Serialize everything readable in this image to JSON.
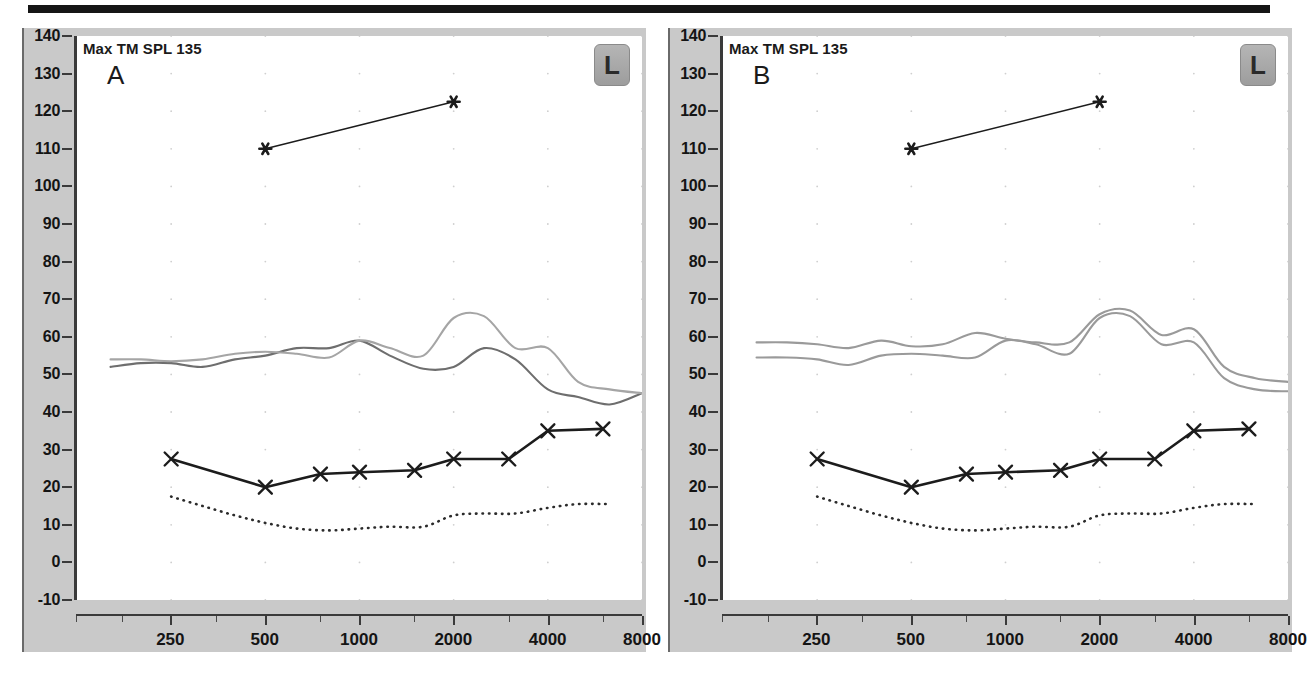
{
  "figure": {
    "top_rule": true,
    "panels": [
      {
        "id": "A",
        "letter": "A",
        "title": "Max TM SPL 135",
        "ear_badge": "L",
        "badge_meaning": "left-ear"
      },
      {
        "id": "B",
        "letter": "B",
        "title": "Max TM SPL 135",
        "ear_badge": "L",
        "badge_meaning": "left-ear"
      }
    ]
  },
  "axes": {
    "y_ticks": [
      140,
      130,
      120,
      110,
      100,
      90,
      80,
      70,
      60,
      50,
      40,
      30,
      20,
      10,
      0,
      -10
    ],
    "y_min": -10,
    "y_max": 140,
    "y_unit": "dB SPL",
    "x_labels": [
      "250",
      "500",
      "1000",
      "2000",
      "4000",
      "8000"
    ],
    "x_values": [
      250,
      500,
      1000,
      2000,
      4000,
      8000
    ],
    "x_minor_values": [
      125,
      175,
      350,
      750,
      1500,
      3000,
      6000
    ],
    "x_min": 125,
    "x_max": 8000,
    "x_unit": "Hz",
    "grid": "dots"
  },
  "colors": {
    "panel_gutter": "#c9c9c9",
    "plot_bg": "#ffffff",
    "axis": "#3a3a3a",
    "text": "#141414",
    "threshold_line": "#1c1c1c",
    "ucl_line": "#1c1c1c",
    "dotted_line": "#2b2b2b",
    "curve_dark_gray": "#6e6e6e",
    "curve_light_gray": "#a5a5a5",
    "top_rule": "#151515",
    "badge": "#a8a8a8"
  },
  "chart_data": [
    {
      "type": "line",
      "title": "Max TM SPL 135",
      "panel": "A",
      "xlabel": "Frequency (Hz)",
      "ylabel": "dB SPL",
      "xlim": [
        125,
        8000
      ],
      "ylim": [
        -10,
        140
      ],
      "xscale": "log",
      "grid": "dotted grid points at octave frequencies and 10 dB steps",
      "legend": "none",
      "annotations": [
        "Max TM SPL 135",
        "A",
        "L"
      ],
      "series": [
        {
          "name": "UCL (asterisk)",
          "marker": "asterisk",
          "style": "solid-thin",
          "color": "#1c1c1c",
          "x": [
            500,
            2000
          ],
          "values": [
            110,
            122.5
          ]
        },
        {
          "name": "Threshold (X marker)",
          "marker": "x",
          "style": "solid-thick",
          "color": "#1c1c1c",
          "x": [
            250,
            500,
            750,
            1000,
            1500,
            2000,
            3000,
            4000,
            6000
          ],
          "values": [
            27.5,
            20,
            23.5,
            24,
            24.5,
            27.5,
            27.5,
            35,
            35.5
          ]
        },
        {
          "name": "Aided response dark gray",
          "style": "solid",
          "color": "#6e6e6e",
          "x": [
            160,
            200,
            250,
            315,
            400,
            500,
            630,
            800,
            1000,
            1250,
            1600,
            2000,
            2500,
            3150,
            4000,
            5000,
            6300,
            8000
          ],
          "values": [
            52,
            53,
            53,
            52,
            54,
            55,
            57,
            57,
            59,
            55,
            51.5,
            52,
            57,
            54,
            46,
            44,
            42,
            45
          ]
        },
        {
          "name": "Aided response light gray",
          "style": "solid",
          "color": "#a5a5a5",
          "x": [
            160,
            200,
            250,
            315,
            400,
            500,
            630,
            800,
            1000,
            1250,
            1600,
            2000,
            2500,
            3150,
            4000,
            5000,
            6300,
            8000
          ],
          "values": [
            54,
            54,
            53.5,
            54,
            55.5,
            56,
            55.5,
            54.5,
            59,
            57,
            55,
            65,
            65.5,
            57,
            57,
            48,
            46,
            45
          ]
        },
        {
          "name": "Unaided / noise floor (dotted)",
          "style": "dotted",
          "color": "#2b2b2b",
          "x": [
            250,
            315,
            400,
            500,
            630,
            800,
            1000,
            1250,
            1600,
            2000,
            2500,
            3150,
            4000,
            5000,
            6300
          ],
          "values": [
            17.5,
            15,
            12.5,
            10.5,
            9,
            8.5,
            9,
            9.5,
            9.5,
            12.5,
            13,
            13,
            14.5,
            15.5,
            15.5
          ]
        }
      ]
    },
    {
      "type": "line",
      "title": "Max TM SPL 135",
      "panel": "B",
      "xlabel": "Frequency (Hz)",
      "ylabel": "dB SPL",
      "xlim": [
        125,
        8000
      ],
      "ylim": [
        -10,
        140
      ],
      "xscale": "log",
      "grid": "dotted grid points at octave frequencies and 10 dB steps",
      "legend": "none",
      "annotations": [
        "Max TM SPL 135",
        "B",
        "L"
      ],
      "series": [
        {
          "name": "UCL (asterisk)",
          "marker": "asterisk",
          "style": "solid-thin",
          "color": "#1c1c1c",
          "x": [
            500,
            2000
          ],
          "values": [
            110,
            122.5
          ]
        },
        {
          "name": "Threshold (X marker)",
          "marker": "x",
          "style": "solid-thick",
          "color": "#1c1c1c",
          "x": [
            250,
            500,
            750,
            1000,
            1500,
            2000,
            3000,
            4000,
            6000
          ],
          "values": [
            27.5,
            20,
            23.5,
            24,
            24.5,
            27.5,
            27.5,
            35,
            35.5
          ]
        },
        {
          "name": "Aided response upper gray",
          "style": "solid",
          "color": "#9a9a9a",
          "x": [
            160,
            200,
            250,
            315,
            400,
            500,
            630,
            800,
            1000,
            1250,
            1600,
            2000,
            2500,
            3150,
            4000,
            5000,
            6300,
            8000
          ],
          "values": [
            58.5,
            58.5,
            58,
            57,
            59,
            57.5,
            58,
            61,
            59.5,
            58.5,
            58.5,
            66,
            67,
            60.5,
            62,
            52,
            49,
            48
          ]
        },
        {
          "name": "Aided response lower gray",
          "style": "solid",
          "color": "#9a9a9a",
          "x": [
            160,
            200,
            250,
            315,
            400,
            500,
            630,
            800,
            1000,
            1250,
            1600,
            2000,
            2500,
            3150,
            4000,
            5000,
            6300,
            8000
          ],
          "values": [
            54.5,
            54.5,
            54,
            52.5,
            55,
            55.5,
            55,
            54.5,
            59,
            58,
            55.5,
            65,
            65.5,
            58,
            58.5,
            49,
            46,
            45.5
          ]
        },
        {
          "name": "Unaided / noise floor (dotted)",
          "style": "dotted",
          "color": "#2b2b2b",
          "x": [
            250,
            315,
            400,
            500,
            630,
            800,
            1000,
            1250,
            1600,
            2000,
            2500,
            3150,
            4000,
            5000,
            6300
          ],
          "values": [
            17.5,
            15,
            12.5,
            10.5,
            9,
            8.5,
            9,
            9.5,
            9.5,
            12.5,
            13,
            13,
            14.5,
            15.5,
            15.5
          ]
        }
      ]
    }
  ]
}
